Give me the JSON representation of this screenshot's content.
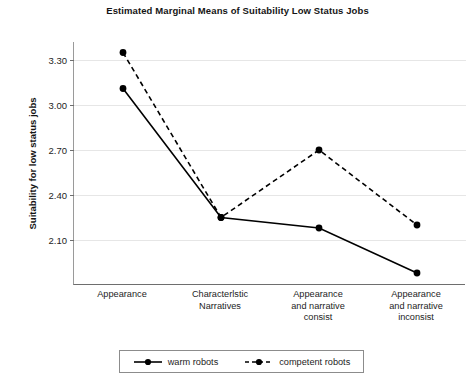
{
  "chart_data": {
    "type": "line",
    "title": "Estimated Marginal Means of Suitability Low Status Jobs",
    "xlabel": "",
    "ylabel": "Suitability for low status jobs",
    "categories": [
      "Appearance",
      "Characterlstic Narratives",
      "Appearance and narrative consist",
      "Appearance and narrative inconsist"
    ],
    "category_lines": [
      [
        "Appearance"
      ],
      [
        "Characterlstic",
        "Narratives"
      ],
      [
        "Appearance",
        "and narrative",
        "consist"
      ],
      [
        "Appearance",
        "and narrative",
        "inconsist"
      ]
    ],
    "series": [
      {
        "name": "warm robots",
        "style": "solid",
        "marker": "circle",
        "color": "#000000",
        "values": [
          3.11,
          2.25,
          2.18,
          1.88
        ]
      },
      {
        "name": "competent robots",
        "style": "dashed",
        "marker": "circle",
        "color": "#000000",
        "values": [
          3.35,
          2.25,
          2.7,
          2.2
        ]
      }
    ],
    "yticks": [
      "3.30",
      "3.00",
      "2.70",
      "2.40",
      "2.10"
    ],
    "ytick_values": [
      3.3,
      3.0,
      2.7,
      2.4,
      2.1
    ],
    "ylim": [
      1.8,
      3.42
    ],
    "grid": true,
    "legend_position": "bottom"
  },
  "legend": {
    "entries": [
      {
        "label": "warm robots",
        "style": "solid"
      },
      {
        "label": "competent robots",
        "style": "dashed"
      }
    ]
  }
}
